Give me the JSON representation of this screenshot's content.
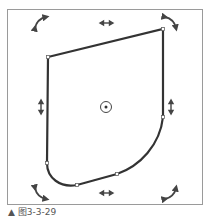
{
  "figure": {
    "caption": "▲ 图3-3-29",
    "colors": {
      "frame": "#9a9a9a",
      "shape_stroke": "#333333",
      "handle": "#555555",
      "background": "#ffffff"
    },
    "shape": {
      "type": "free-transform-path",
      "anchor_points": [
        {
          "name": "top-left",
          "x": 48,
          "y": 57
        },
        {
          "name": "top-right",
          "x": 163,
          "y": 29
        },
        {
          "name": "right-lower",
          "x": 163,
          "y": 117
        },
        {
          "name": "bottom-right",
          "x": 117,
          "y": 174
        },
        {
          "name": "bottom-mid",
          "x": 77,
          "y": 185
        },
        {
          "name": "left-lower",
          "x": 47,
          "y": 163
        }
      ],
      "center_point": {
        "x": 106,
        "y": 107
      }
    },
    "handles": {
      "rotate": [
        "top-left",
        "top-right",
        "bottom-left",
        "bottom-right"
      ],
      "scale_horizontal": [
        "top",
        "bottom"
      ],
      "scale_vertical": [
        "left",
        "right"
      ]
    }
  }
}
